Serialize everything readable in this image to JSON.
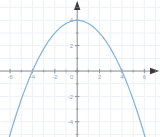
{
  "chart_data": {
    "type": "line",
    "title": "",
    "subtitle": "",
    "xlabel": "",
    "ylabel": "",
    "xlim": [
      -6.9,
      7.4
    ],
    "ylim": [
      -5.2,
      5.6
    ],
    "grid": true,
    "grid_step": 1,
    "legend": "none",
    "x_ticks": [
      -6,
      -4,
      -2,
      0,
      2,
      4,
      6
    ],
    "x_tick_labels": [
      "-6",
      "-4",
      "-2",
      "0",
      "2",
      "4",
      "6"
    ],
    "y_ticks": [
      -4,
      -2,
      0,
      2,
      4
    ],
    "y_tick_labels": [
      "-4",
      "-2",
      "0",
      "2",
      "4"
    ],
    "series": [
      {
        "name": "parabola",
        "equation": "y = -0.25x^2 + 4",
        "color": "#7fb2dd",
        "vertex": [
          0,
          4
        ],
        "x_intercepts": [
          -4,
          4
        ],
        "y_intercept": 4,
        "opens": "down",
        "x": [
          -6.6,
          -6.2,
          -5.8,
          -5.4,
          -5.0,
          -4.6,
          -4.2,
          -3.8,
          -3.4,
          -3.0,
          -2.6,
          -2.2,
          -1.8,
          -1.4,
          -1.0,
          -0.6,
          -0.2,
          0.2,
          0.6,
          1.0,
          1.4,
          1.8,
          2.2,
          2.6,
          3.0,
          3.4,
          3.8,
          4.2,
          4.6,
          5.0,
          5.4,
          5.8,
          6.2,
          6.6
        ],
        "y": [
          -6.89,
          -5.61,
          -4.41,
          -3.29,
          -2.25,
          -1.29,
          -0.41,
          0.39,
          1.11,
          1.75,
          2.31,
          2.79,
          3.19,
          3.51,
          3.75,
          3.91,
          3.99,
          3.99,
          3.91,
          3.75,
          3.51,
          3.19,
          2.79,
          2.31,
          1.75,
          1.11,
          0.39,
          -0.41,
          -1.29,
          -2.25,
          -3.29,
          -4.41,
          -5.61,
          -6.89
        ]
      }
    ],
    "axis_color": "#8d8f95",
    "grid_color": "#eef1f5",
    "axes": {
      "x_axis_arrow": "right",
      "y_axis_arrow": "up",
      "origin_label": "0"
    }
  }
}
